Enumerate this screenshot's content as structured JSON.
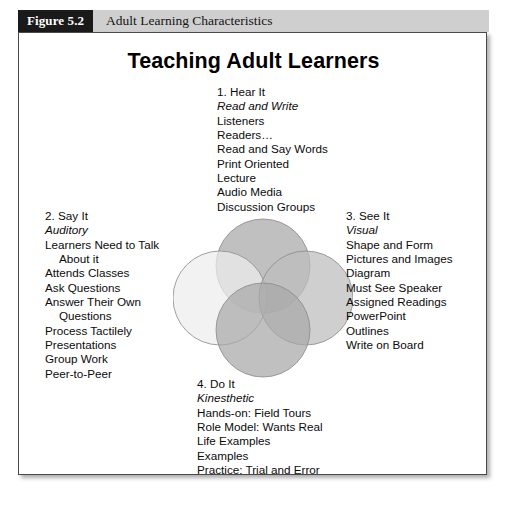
{
  "caption": {
    "number": "Figure 5.2",
    "title": "Adult Learning Characteristics"
  },
  "figure": {
    "title": "Teaching Adult Learners"
  },
  "quadrants": {
    "hear": {
      "heading": "1. Hear It",
      "subtitle": "Read and Write",
      "items": [
        "Listeners",
        "Readers…",
        "Read and Say Words",
        "Print Oriented",
        "Lecture",
        "Audio Media",
        "Discussion Groups"
      ]
    },
    "say": {
      "heading": "2. Say  It",
      "subtitle": "Auditory",
      "items": [
        "Learners Need to Talk",
        "About it",
        "Attends Classes",
        "Ask Questions",
        "Answer Their Own",
        "Questions",
        "Process Tactilely",
        "Presentations",
        "Group Work",
        "Peer-to-Peer"
      ]
    },
    "see": {
      "heading": "3. See It",
      "subtitle": "Visual",
      "items": [
        "Shape and Form",
        "Pictures and Images",
        "Diagram",
        "Must See Speaker",
        "Assigned Readings",
        "PowerPoint",
        "Outlines",
        "Write on Board"
      ]
    },
    "do": {
      "heading": "4. Do It",
      "subtitle": "Kinesthetic",
      "items": [
        "Hands-on: Field Tours",
        "Role Model: Wants Real",
        "Life Examples",
        "Examples",
        "Practice: Trial and Error"
      ]
    }
  },
  "venn": {
    "circles": [
      {
        "name": "hear-circle",
        "cx": 90,
        "cy": 48,
        "r": 47,
        "fill": "#a8a8a8",
        "label": "1. Hear It"
      },
      {
        "name": "say-circle",
        "cx": 47,
        "cy": 80,
        "r": 47,
        "fill": "#ededed",
        "label": "2. Say It"
      },
      {
        "name": "see-circle",
        "cx": 133,
        "cy": 80,
        "r": 47,
        "fill": "#bdbdbd",
        "label": "3. See It"
      },
      {
        "name": "do-circle",
        "cx": 90,
        "cy": 112,
        "r": 47,
        "fill": "#a8a8a8",
        "label": "4. Do It"
      }
    ],
    "stroke": "#8a8a8a"
  },
  "colors": {
    "caption_bar": "#cfcfcf",
    "caption_number_bg": "#1a1a1a",
    "frame_border": "#4a4a4a",
    "page_background": "#ffffff"
  }
}
